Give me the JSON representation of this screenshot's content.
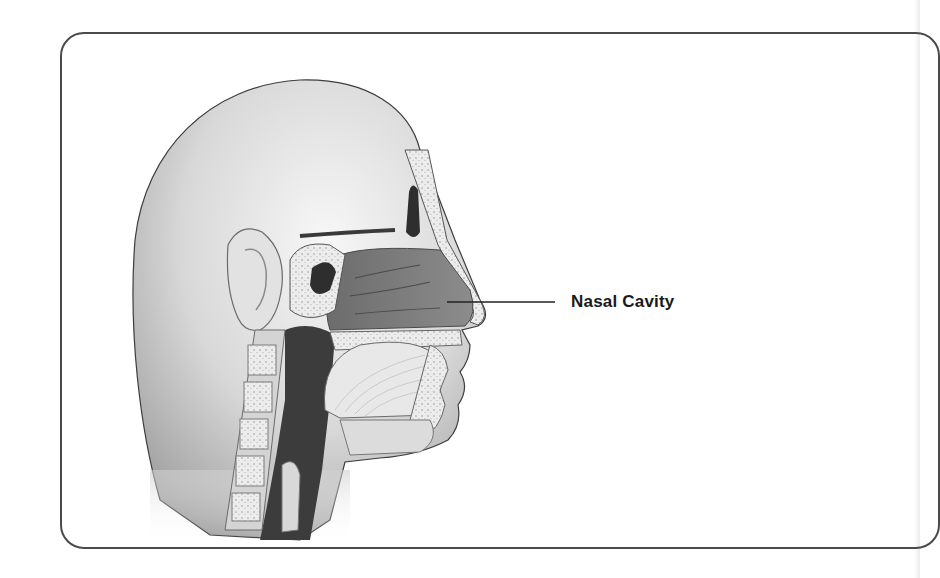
{
  "diagram": {
    "labels": [
      {
        "text": "Nasal Cavity",
        "target": "nasal-cavity"
      }
    ]
  },
  "colors": {
    "frame": "#4a4a4a",
    "skin_light": "#f2f2f2",
    "skin_shadow": "#9a9a9a",
    "cavity": "#7a7a7a",
    "dark_airway": "#3c3c3c",
    "bone": "#e6e6e6",
    "label_text": "#1a1a1a"
  }
}
